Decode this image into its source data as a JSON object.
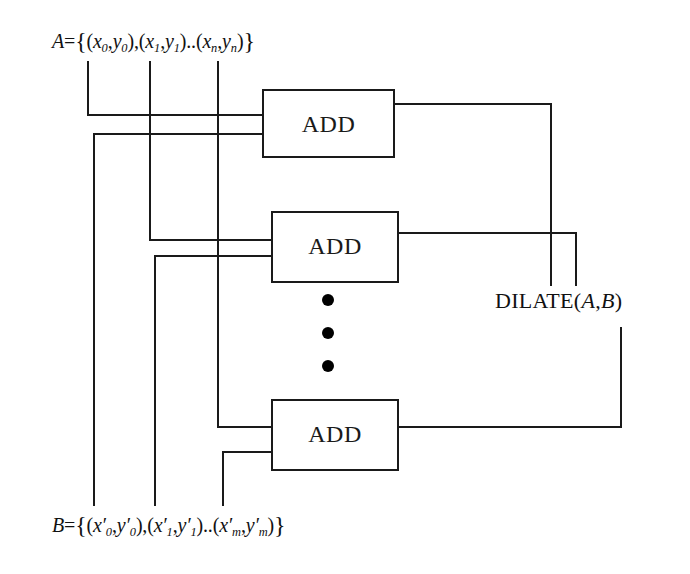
{
  "diagram": {
    "background_color": "#ffffff",
    "line_color": "#1a1a1a",
    "inputs": {
      "a": {
        "name": "A",
        "text": "A={(x0,y0),(x1,y1)...(xn,yn)}",
        "parts": {
          "lhs": "A",
          "eq": "=",
          "open_brace": "{",
          "pair0": {
            "x": "x",
            "xsub": "0",
            "comma": ",",
            "y": "y",
            "ysub": "0"
          },
          "pair1": {
            "x": "x",
            "xsub": "1",
            "comma": ",",
            "y": "y",
            "ysub": "1"
          },
          "ellipsis": "..",
          "pairn": {
            "x": "x",
            "xsub": "n",
            "comma": ",",
            "y": "y",
            "ysub": "n"
          },
          "close_brace": "}"
        }
      },
      "b": {
        "name": "B",
        "text": "B={(x'0,y'0),(x'1,y'1)...(x'm,y'm)}",
        "parts": {
          "lhs": "B",
          "eq": "=",
          "open_brace": "{",
          "pair0": {
            "x": "x",
            "prime": "′",
            "xsub": "0",
            "comma": ",",
            "y": "y",
            "ysub": "0"
          },
          "pair1": {
            "x": "x",
            "prime": "′",
            "xsub": "1",
            "comma": ",",
            "y": "y",
            "ysub": "1"
          },
          "ellipsis": "..",
          "pairm": {
            "x": "x",
            "prime": "′",
            "xsub": "m",
            "comma": ",",
            "y": "y",
            "ysub": "m"
          },
          "close_brace": "}"
        }
      }
    },
    "blocks": [
      {
        "id": "add-1",
        "label": "ADD",
        "x": 263,
        "y": 90,
        "width": 131,
        "height": 67
      },
      {
        "id": "add-2",
        "label": "ADD",
        "x": 272,
        "y": 212,
        "width": 126,
        "height": 70
      },
      {
        "id": "add-3",
        "label": "ADD",
        "x": 272,
        "y": 400,
        "width": 126,
        "height": 70
      }
    ],
    "vertical_ellipsis": {
      "name": "vertical-ellipsis",
      "dot_count": 3,
      "x": 328,
      "ys": [
        300,
        333,
        366
      ],
      "radius": 6,
      "color": "#000000"
    },
    "output": {
      "label": "DILATE(A,B)",
      "parts": {
        "fn": "DILATE",
        "open": "(",
        "a": "A",
        "comma": ",",
        "b": "B",
        "close": ")"
      }
    }
  }
}
